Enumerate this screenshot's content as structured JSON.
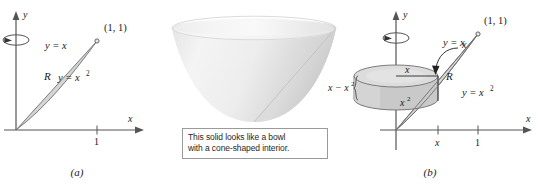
{
  "figure": {
    "panel_a": {
      "caption": "(a)",
      "axis_x_label": "x",
      "axis_y_label": "y",
      "tick_x_1": "1",
      "point_label": "(1, 1)",
      "curve_upper_label": "y = x",
      "curve_lower_label": "y = x",
      "curve_lower_exponent": "2",
      "region_label": "R",
      "rotation_icon": "revolve-about-y-axis"
    },
    "panel_middle": {
      "solid_name": "parabolic-bowl-with-conical-interior",
      "callout_line1": "This solid looks like a bowl",
      "callout_line2": "with a cone-shaped interior."
    },
    "panel_b": {
      "caption": "(b)",
      "axis_x_label": "x",
      "axis_y_label": "y",
      "tick_x_var": "x",
      "tick_x_1": "1",
      "point_label": "(1, 1)",
      "curve_upper_label": "y = x",
      "curve_lower_label": "y = x",
      "curve_lower_exponent": "2",
      "region_label": "R",
      "radius_label": "x",
      "shell_top_label": "x",
      "shell_bottom_label": "x",
      "shell_bottom_exponent": "2",
      "height_label": "x − x",
      "height_exponent": "2",
      "rotation_icon": "revolve-about-y-axis"
    }
  },
  "colors": {
    "axis": "#555555",
    "curve": "#4a4a4a",
    "region_fill": "#d5d5d5",
    "shell_fill": "#c9c9c9",
    "shell_top": "#dcdcdc",
    "solid_light": "#f0f0f0",
    "solid_mid": "#dddddd",
    "solid_dark": "#c6c6c6",
    "text": "#1a1a1a",
    "callout_border": "#9a9a9a"
  }
}
